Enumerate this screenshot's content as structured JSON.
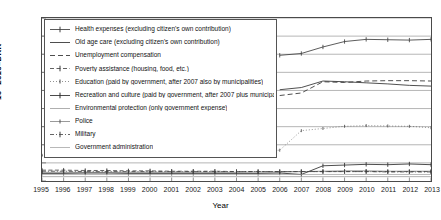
{
  "chart_data": {
    "type": "line",
    "title": "",
    "xlabel": "Year",
    "ylabel": "10^9 2010-DKK",
    "ylabel_mantissa": "10",
    "ylabel_exponent": "9",
    "ylabel_unit": " 2010–DKK",
    "xlim": [
      1995,
      2013
    ],
    "ylim": [
      0,
      450
    ],
    "grid": "horizontal",
    "legend_position": "upper-left-inside",
    "x": [
      1995,
      1996,
      1997,
      1998,
      1999,
      2000,
      2001,
      2002,
      2003,
      2004,
      2005,
      2006,
      2007,
      2008,
      2009,
      2010,
      2011,
      2012,
      2013
    ],
    "yticks": [
      0,
      50,
      100,
      150,
      200,
      250,
      300,
      350,
      400,
      450
    ],
    "xticks": [
      1995,
      1996,
      1997,
      1998,
      1999,
      2000,
      2001,
      2002,
      2003,
      2004,
      2005,
      2006,
      2007,
      2008,
      2009,
      2010,
      2011,
      2012,
      2013
    ],
    "series": [
      {
        "name": "Health expenses (excluding citizen's own contribution)",
        "style": "solid-marker",
        "color": "#3d3d3d",
        "values": [
          null,
          null,
          null,
          null,
          null,
          null,
          null,
          null,
          null,
          null,
          null,
          347,
          352,
          370,
          385,
          391,
          390,
          389,
          391
        ]
      },
      {
        "name": "Old age care (excluding citizen's own contribution)",
        "style": "solid",
        "color": "#2e2e2e",
        "values": [
          null,
          null,
          null,
          null,
          null,
          null,
          null,
          null,
          null,
          null,
          null,
          252,
          258,
          276,
          274,
          271,
          268,
          264,
          262
        ]
      },
      {
        "name": "Unemployment compensation",
        "style": "dashed",
        "color": "#2e2e2e",
        "values": [
          null,
          null,
          null,
          null,
          null,
          null,
          null,
          null,
          null,
          null,
          null,
          236,
          243,
          274,
          272,
          276,
          277,
          277,
          276
        ]
      },
      {
        "name": "Poverty assistance (housing, food, etc.)",
        "style": "dash-marker",
        "color": "#3a3a3a",
        "values": [
          30,
          30,
          29,
          29,
          28,
          28,
          27,
          27,
          27,
          26,
          26,
          26,
          26,
          26,
          26,
          26,
          26,
          26,
          26
        ]
      },
      {
        "name": "Education (paid by government, after 2007 also by municipalities)",
        "style": "dotted-marker",
        "color": "#4a4a4a",
        "values": [
          71,
          73,
          73,
          75,
          78,
          78,
          79,
          81,
          83,
          85,
          83,
          85,
          139,
          145,
          151,
          153,
          152,
          151,
          147
        ]
      },
      {
        "name": "Recreation and culture (paid by government, after 2007 plus municipalities)",
        "style": "solid-marker",
        "color": "#2b2b2b",
        "values": [
          21,
          21,
          22,
          22,
          21,
          21,
          21,
          21,
          21,
          21,
          21,
          22,
          18,
          42,
          44,
          46,
          45,
          47,
          45
        ]
      },
      {
        "name": "Environmental protection (only government expense)",
        "style": "solid-light",
        "color": "#8c8c8c",
        "values": [
          12,
          12,
          12,
          12,
          12,
          12,
          12,
          12,
          12,
          12,
          12,
          12,
          12,
          12,
          12,
          12,
          12,
          12,
          12
        ]
      },
      {
        "name": "Police",
        "style": "thin-marker",
        "color": "#555555",
        "values": [
          24,
          24,
          24,
          24,
          24,
          24,
          24,
          24,
          24,
          24,
          25,
          25,
          26,
          27,
          28,
          28,
          27,
          27,
          27
        ]
      },
      {
        "name": "Military",
        "style": "dash-dot",
        "color": "#3f3f3f",
        "values": [
          27,
          27,
          26,
          26,
          26,
          26,
          26,
          26,
          26,
          26,
          26,
          26,
          26,
          26,
          26,
          26,
          25,
          25,
          25
        ]
      },
      {
        "name": "Government administration",
        "style": "solid-grey",
        "color": "#9a9a9a",
        "values": [
          18,
          18,
          18,
          18,
          18,
          18,
          18,
          18,
          18,
          18,
          18,
          18,
          18,
          18,
          18,
          18,
          18,
          18,
          18
        ]
      }
    ]
  },
  "legend": {
    "items": [
      "Health expenses (excluding citizen's own contribution)",
      "Old age care (excluding citizen's own contribution)",
      "Unemployment compensation",
      "Poverty assistance (housing, food, etc.)",
      "Education (paid by government, after 2007 also by municipalities)",
      "Recreation and culture (paid by government, after 2007 plus municipalities)",
      "Environmental protection (only government expense)",
      "Police",
      "Military",
      "Government administration"
    ]
  },
  "axes": {
    "x_title": "Year",
    "y_tick_labels": [
      "0",
      "50",
      "100",
      "150",
      "200",
      "250",
      "300",
      "350",
      "400",
      "450"
    ],
    "x_tick_labels": [
      "1995",
      "1996",
      "1997",
      "1998",
      "1999",
      "2000",
      "2001",
      "2002",
      "2003",
      "2004",
      "2005",
      "2006",
      "2007",
      "2008",
      "2009",
      "2010",
      "2011",
      "2012",
      "2013"
    ]
  }
}
